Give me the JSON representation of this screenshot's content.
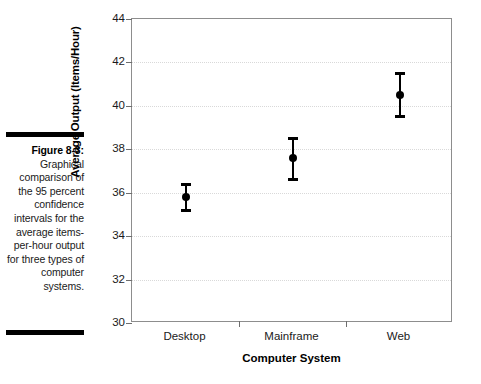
{
  "caption": {
    "label": "Figure 8-3:",
    "body": "Graphical comparison of the 95 percent confidence intervals for the average items-per-hour output for three types of computer systems."
  },
  "chart_data": {
    "type": "scatter",
    "title": "",
    "xlabel": "Computer System",
    "ylabel": "Average Output (Items/Hour)",
    "categories": [
      "Desktop",
      "Mainframe",
      "Web"
    ],
    "values": [
      35.8,
      37.6,
      40.5
    ],
    "error_low": [
      35.2,
      36.6,
      39.5
    ],
    "error_high": [
      36.4,
      38.5,
      41.5
    ],
    "ylim": [
      30,
      44
    ],
    "yticks": [
      30,
      32,
      34,
      36,
      38,
      40,
      42,
      44
    ],
    "grid": true,
    "legend": "none",
    "series": [
      {
        "name": "95% confidence interval",
        "points": [
          {
            "category": "Desktop",
            "mean": 35.8,
            "lower": 35.2,
            "upper": 36.4
          },
          {
            "category": "Mainframe",
            "mean": 37.6,
            "lower": 36.6,
            "upper": 38.5
          },
          {
            "category": "Web",
            "mean": 40.5,
            "lower": 39.5,
            "upper": 41.5
          }
        ]
      }
    ],
    "marker_color": "#000000",
    "grid_color": "#d9d9d9",
    "axis_color": "#8d8d8d"
  }
}
